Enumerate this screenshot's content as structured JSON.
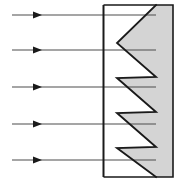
{
  "figure": {
    "canvas": {
      "width": 181,
      "height": 190,
      "background": "#ffffff"
    },
    "colors": {
      "stroke": "#1a1a1a",
      "ray_stroke": "#4d4d4d",
      "material_fill": "#d4d4d4",
      "background": "#ffffff"
    },
    "boundary_line": {
      "name": "surface-boundary-line",
      "x": 103.5,
      "y_top": 5,
      "y_bottom": 177,
      "stroke_width": 2
    },
    "enclosure": {
      "name": "material-outline",
      "left": 103.5,
      "right": 173,
      "top": 5,
      "bottom": 177,
      "stroke_width": 1.6
    },
    "sawtooth": {
      "name": "sawtooth-profile",
      "teeth_count": 5,
      "tip_x": 117,
      "valley_x": 156,
      "points": [
        [
          156,
          5
        ],
        [
          117,
          43
        ],
        [
          156,
          77
        ],
        [
          117,
          78
        ],
        [
          156,
          112
        ],
        [
          117,
          113
        ],
        [
          156,
          147
        ],
        [
          117,
          148
        ],
        [
          156,
          177
        ]
      ],
      "path": "M 173,5 L 156,5 L 117,43 L 156,77 L 117,78 L 156,112 L 117,113 L 156,147 L 117,148 L 156,177 L 173,177 Z",
      "outline_path": "M 156,5 L 117,43 L 156,77 L 117,78 L 156,112 L 117,113 L 156,147 L 117,148 L 156,177"
    },
    "rays": [
      {
        "name": "incident-ray-1",
        "y": 15,
        "x_start": 12,
        "x_end": 156,
        "arrow_x": 42
      },
      {
        "name": "incident-ray-2",
        "y": 50,
        "x_start": 12,
        "x_end": 156,
        "arrow_x": 42
      },
      {
        "name": "incident-ray-3",
        "y": 87,
        "x_start": 12,
        "x_end": 156,
        "arrow_x": 42
      },
      {
        "name": "incident-ray-4",
        "y": 124,
        "x_start": 12,
        "x_end": 156,
        "arrow_x": 42
      },
      {
        "name": "incident-ray-5",
        "y": 160,
        "x_start": 12,
        "x_end": 156,
        "arrow_x": 42
      }
    ],
    "ray_style": {
      "stroke_width": 1.1,
      "arrow_half_height": 3.6,
      "arrow_length": 9
    }
  }
}
